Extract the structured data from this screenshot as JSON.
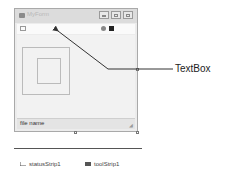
{
  "form": {
    "title": "MyForm",
    "window_buttons": [
      "minimize",
      "maximize",
      "close"
    ],
    "toolbar_icons": [
      "open-icon",
      "attach-icon",
      "stop-icon"
    ],
    "status_text": "file name"
  },
  "callout": {
    "label": "TextBox"
  },
  "component_tray": {
    "items": [
      {
        "label": "statusStrip1",
        "icon": "statusstrip-icon"
      },
      {
        "label": "toolStrip1",
        "icon": "toolstrip-icon"
      }
    ]
  },
  "colors": {
    "form_bg": "#ececec",
    "titlebar_bg": "#dcdcdc",
    "arrow": "#333333"
  }
}
